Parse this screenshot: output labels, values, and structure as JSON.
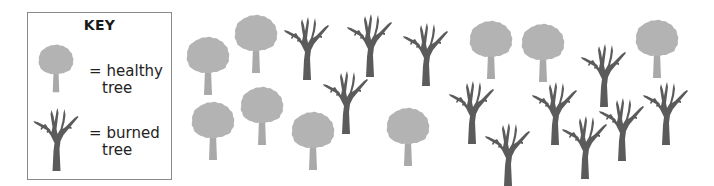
{
  "key": {
    "title": "KEY",
    "items": [
      {
        "type": "healthy",
        "equals": "=",
        "line1": "healthy",
        "line2": "tree"
      },
      {
        "type": "burned",
        "equals": "=",
        "line1": "burned",
        "line2": "tree"
      }
    ]
  },
  "colors": {
    "healthy_crown": "#b3b3b3",
    "healthy_trunk": "#a9a9a9",
    "burned": "#5b5b5b",
    "key_border": "#8a8a8a"
  },
  "counts": {
    "healthy": 9,
    "burned": 11
  },
  "trees": [
    {
      "type": "healthy",
      "x": 186,
      "y": 36
    },
    {
      "type": "healthy",
      "x": 234,
      "y": 14
    },
    {
      "type": "healthy",
      "x": 191,
      "y": 101
    },
    {
      "type": "healthy",
      "x": 240,
      "y": 86
    },
    {
      "type": "healthy",
      "x": 291,
      "y": 111
    },
    {
      "type": "healthy",
      "x": 386,
      "y": 107
    },
    {
      "type": "healthy",
      "x": 469,
      "y": 20
    },
    {
      "type": "healthy",
      "x": 521,
      "y": 23
    },
    {
      "type": "healthy",
      "x": 635,
      "y": 19
    },
    {
      "type": "burned",
      "x": 284,
      "y": 16
    },
    {
      "type": "burned",
      "x": 347,
      "y": 13
    },
    {
      "type": "burned",
      "x": 403,
      "y": 22
    },
    {
      "type": "burned",
      "x": 323,
      "y": 70
    },
    {
      "type": "burned",
      "x": 449,
      "y": 80
    },
    {
      "type": "burned",
      "x": 485,
      "y": 122
    },
    {
      "type": "burned",
      "x": 581,
      "y": 43
    },
    {
      "type": "burned",
      "x": 532,
      "y": 81
    },
    {
      "type": "burned",
      "x": 562,
      "y": 115
    },
    {
      "type": "burned",
      "x": 599,
      "y": 97
    },
    {
      "type": "burned",
      "x": 643,
      "y": 81
    }
  ]
}
